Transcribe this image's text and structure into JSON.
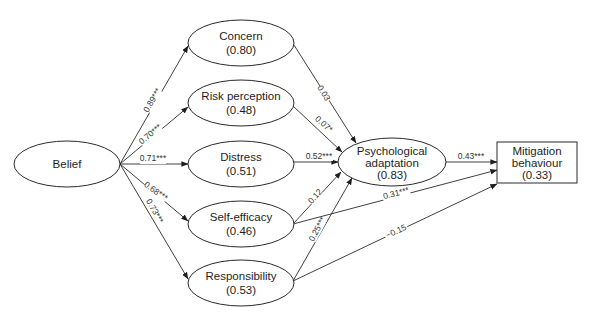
{
  "diagram": {
    "type": "path-model",
    "nodes": {
      "belief": {
        "label": "Belief",
        "value": "",
        "shape": "ellipse"
      },
      "concern": {
        "label": "Concern",
        "value": "(0.80)",
        "shape": "ellipse"
      },
      "risk": {
        "label": "Risk perception",
        "value": "(0.48)",
        "shape": "ellipse"
      },
      "distress": {
        "label": "Distress",
        "value": "(0.51)",
        "shape": "ellipse"
      },
      "selfefficacy": {
        "label": "Self-efficacy",
        "value": "(0.46)",
        "shape": "ellipse"
      },
      "responsibility": {
        "label": "Responsibility",
        "value": "(0.53)",
        "shape": "ellipse"
      },
      "psych": {
        "label_line1": "Psychological",
        "label_line2": "adaptation",
        "value": "(0.83)",
        "shape": "ellipse"
      },
      "mitigation": {
        "label_line1": "Mitigation",
        "label_line2": "behaviour",
        "value": "(0.33)",
        "shape": "rectangle"
      }
    },
    "edges": {
      "belief_concern": {
        "from": "Belief",
        "to": "Concern",
        "label": "0.89***"
      },
      "belief_risk": {
        "from": "Belief",
        "to": "Risk perception",
        "label": "0.70***"
      },
      "belief_distress": {
        "from": "Belief",
        "to": "Distress",
        "label": "0.71***"
      },
      "belief_selfefficacy": {
        "from": "Belief",
        "to": "Self-efficacy",
        "label": "0.68***"
      },
      "belief_responsibility": {
        "from": "Belief",
        "to": "Responsibility",
        "label": "0.73***"
      },
      "concern_psych": {
        "from": "Concern",
        "to": "Psychological adaptation",
        "label": "0.03"
      },
      "risk_psych": {
        "from": "Risk perception",
        "to": "Psychological adaptation",
        "label": "0.07*"
      },
      "distress_psych": {
        "from": "Distress",
        "to": "Psychological adaptation",
        "label": "0.52***"
      },
      "selfefficacy_psych": {
        "from": "Self-efficacy",
        "to": "Psychological adaptation",
        "label": "0.12"
      },
      "responsibility_psych": {
        "from": "Responsibility",
        "to": "Psychological adaptation",
        "label": "0.25***"
      },
      "psych_mitigation": {
        "from": "Psychological adaptation",
        "to": "Mitigation behaviour",
        "label": "0.43***"
      },
      "selfefficacy_mitigation": {
        "from": "Self-efficacy",
        "to": "Mitigation behaviour",
        "label": "0.31***"
      },
      "responsibility_mitigation": {
        "from": "Responsibility",
        "to": "Mitigation behaviour",
        "label": "−0.15"
      }
    }
  }
}
